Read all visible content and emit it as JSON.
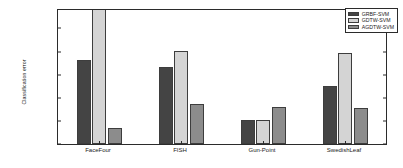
{
  "chart_data": {
    "type": "bar",
    "title": "",
    "xlabel": "",
    "ylabel": "Classification error",
    "categories": [
      "FaceFour",
      "FISH",
      "Gun-Point",
      "SwedishLeaf"
    ],
    "series": [
      {
        "name": "GRBF-SVM",
        "color": "#444444",
        "values": [
          0.182,
          0.166,
          0.053,
          0.125
        ]
      },
      {
        "name": "GDTW-SVM",
        "color": "#d4d4d4",
        "values": [
          0.295,
          0.201,
          0.053,
          0.197
        ]
      },
      {
        "name": "AGDTW-SVM",
        "color": "#8c8c8c",
        "values": [
          0.034,
          0.086,
          0.08,
          0.077
        ]
      }
    ],
    "ylim": [
      0,
      0.29
    ],
    "yticks": [
      0,
      0.05,
      0.1,
      0.15,
      0.2,
      0.25
    ],
    "ytick_labels": [
      "0",
      "0.05",
      "0.1",
      "0.15",
      "0.2",
      "0.25"
    ],
    "grid": false,
    "legend_position": "top-right"
  },
  "legend": {
    "entries": [
      {
        "label": "GRBF-SVM"
      },
      {
        "label": "GDTW-SVM"
      },
      {
        "label": "AGDTW-SVM"
      }
    ]
  }
}
